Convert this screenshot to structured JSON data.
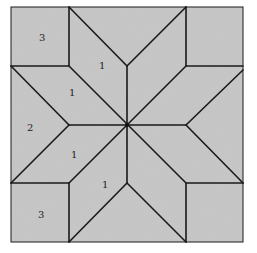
{
  "diagram": {
    "colors": {
      "background": "#ffffff",
      "fill": "#c9c9c9",
      "line": "#1a1a1a"
    },
    "labels": [
      {
        "id": "corner-top-left",
        "text": "3",
        "x": 39,
        "y": 41
      },
      {
        "id": "diamond-top",
        "text": "1",
        "x": 99,
        "y": 69
      },
      {
        "id": "diamond-upper-left",
        "text": "1",
        "x": 69,
        "y": 96
      },
      {
        "id": "triangle-left",
        "text": "2",
        "x": 30,
        "y": 131
      },
      {
        "id": "diamond-lower-left",
        "text": "1",
        "x": 71,
        "y": 158
      },
      {
        "id": "diamond-bottom",
        "text": "1",
        "x": 104,
        "y": 188
      },
      {
        "id": "corner-bottom-left",
        "text": "3",
        "x": 40,
        "y": 218
      }
    ]
  }
}
